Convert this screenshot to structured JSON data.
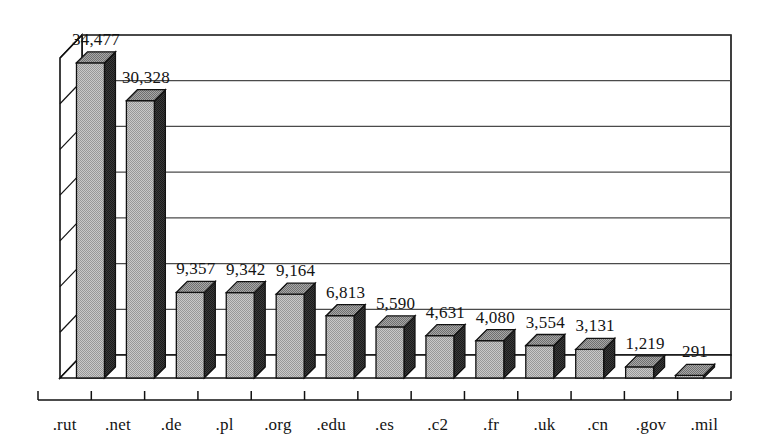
{
  "chart_data": {
    "type": "bar",
    "title": "",
    "subtitle": "",
    "xlabel": "",
    "ylabel": "",
    "categories": [
      ".rut",
      ".net",
      ".de",
      ".pl",
      ".org",
      ".edu",
      ".es",
      ".c2",
      ".fr",
      ".uk",
      ".cn",
      ".gov",
      ".mil"
    ],
    "values": [
      34477,
      30328,
      9357,
      9342,
      9164,
      6813,
      5590,
      4631,
      4080,
      3554,
      3131,
      1219,
      291
    ],
    "value_labels": [
      "34,477",
      "30,328",
      "9,357",
      "9,342",
      "9,164",
      "6,813",
      "5,590",
      "4,631",
      "4,080",
      "3,554",
      "3,131",
      "1,219",
      "291"
    ],
    "ylim": [
      0,
      35000
    ],
    "gridlines": [
      5000,
      10000,
      15000,
      20000,
      25000,
      30000,
      35000
    ],
    "grid": true,
    "legend": "none",
    "style": "3d-column",
    "tick_labels_y": [],
    "annotations": []
  },
  "colors": {
    "background": "#ffffff",
    "bar_front": "#b4b4b4",
    "bar_side": "#2b2b2b",
    "bar_top": "#8c8c8c",
    "outline": "#111111",
    "gridline": "#4a4a4a",
    "axis": "#111111",
    "label_text": "#141414"
  },
  "icons": {
    "chart_icon": "bar-chart-icon"
  }
}
